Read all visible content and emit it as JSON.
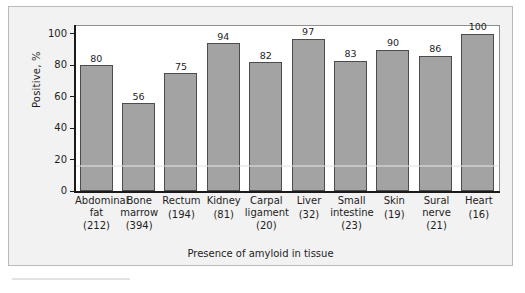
{
  "chart_data": {
    "type": "bar",
    "title": "",
    "xlabel": "Presence of amyloid in tissue",
    "ylabel": "Positive, %",
    "ylim": [
      0,
      105
    ],
    "yticks": [
      0,
      20,
      40,
      60,
      80,
      100
    ],
    "grid": false,
    "legend": null,
    "categories": [
      "Abdominal fat",
      "Bone marrow",
      "Rectum",
      "Kidney",
      "Carpal ligament",
      "Liver",
      "Small intestine",
      "Skin",
      "Sural nerve",
      "Heart"
    ],
    "category_lines": [
      [
        "Abdominal",
        "fat"
      ],
      [
        "Bone",
        "marrow"
      ],
      [
        "Rectum"
      ],
      [
        "Kidney"
      ],
      [
        "Carpal",
        "ligament"
      ],
      [
        "Liver"
      ],
      [
        "Small",
        "intestine"
      ],
      [
        "Skin"
      ],
      [
        "Sural",
        "nerve"
      ],
      [
        "Heart"
      ]
    ],
    "counts": [
      "(212)",
      "(394)",
      "(194)",
      "(81)",
      "(20)",
      "(32)",
      "(23)",
      "(19)",
      "(21)",
      "(16)"
    ],
    "values": [
      80,
      56,
      75,
      94,
      82,
      97,
      83,
      90,
      86,
      100
    ],
    "value_labels": [
      "80",
      "56",
      "75",
      "94",
      "82",
      "97",
      "83",
      "90",
      "86",
      "100"
    ],
    "colors": {
      "bar_fill": "#a3a3a3",
      "bar_edge": "#4c4c4c",
      "axis": "#1a1a1a",
      "text": "#1d1d1d",
      "figure_background": "#f2f2f2",
      "plot_background": "#ffffff",
      "figure_border": "#b9b9b9"
    }
  }
}
